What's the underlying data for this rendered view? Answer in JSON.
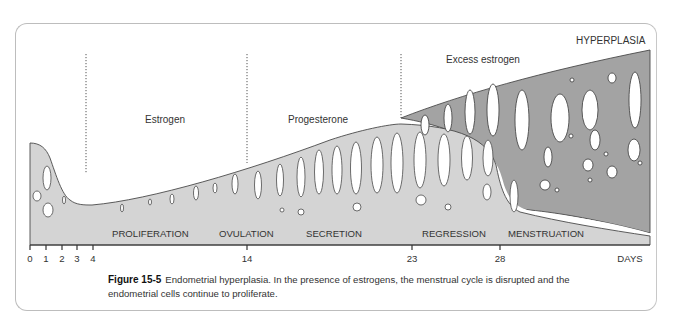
{
  "figure": {
    "number_label": "Figure 15-5",
    "caption_text": "Endometrial hyperplasia. In the presence of estrogens, the menstrual cycle is disrupted and the endometrial cells continue to proliferate."
  },
  "labels": {
    "hormones": {
      "estrogen": "Estrogen",
      "progesterone": "Progesterone",
      "excess_estrogen": "Excess estrogen"
    },
    "condition": "HYPERPLASIA",
    "phases": [
      {
        "label": "PROLIFERATION"
      },
      {
        "label": "OVULATION"
      },
      {
        "label": "SECRETION"
      },
      {
        "label": "REGRESSION"
      },
      {
        "label": "MENSTRUATION"
      }
    ],
    "axis": {
      "unit": "DAYS",
      "ticks": [
        "0",
        "1",
        "2",
        "3",
        "4",
        "14",
        "23",
        "28"
      ]
    }
  },
  "colors": {
    "normal_tissue": "#d4d4d4",
    "hyperplasia_tissue": "#a3a3a3",
    "outline": "#4a4a4a",
    "gland_lumen": "#ffffff",
    "text": "#333333",
    "frame_border": "#bdbdbd"
  }
}
